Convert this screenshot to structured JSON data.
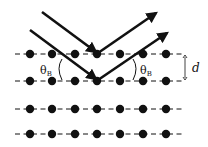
{
  "diagram": {
    "colors": {
      "ink": "#111111",
      "background": "#ffffff"
    },
    "lattice": {
      "rows_y": [
        54,
        81,
        109,
        134
      ],
      "dots_x": [
        30,
        52,
        75,
        97,
        120,
        143,
        166
      ],
      "dot_radius": 4.2,
      "line_x_start": 15,
      "line_x_end": 185
    },
    "labels": {
      "theta_left": "θ",
      "theta_left_sub": "B",
      "theta_right": "θ",
      "theta_right_sub": "B",
      "spacing": "d"
    },
    "rays": [
      {
        "name": "incident-ray-1",
        "x1": 42,
        "y1": 12,
        "x2": 96,
        "y2": 52
      },
      {
        "name": "reflected-ray-1",
        "x1": 98,
        "y1": 53,
        "x2": 156,
        "y2": 13
      },
      {
        "name": "incident-ray-2",
        "x1": 30,
        "y1": 30,
        "x2": 96,
        "y2": 79
      },
      {
        "name": "reflected-ray-2",
        "x1": 98,
        "y1": 80,
        "x2": 167,
        "y2": 33
      }
    ]
  }
}
